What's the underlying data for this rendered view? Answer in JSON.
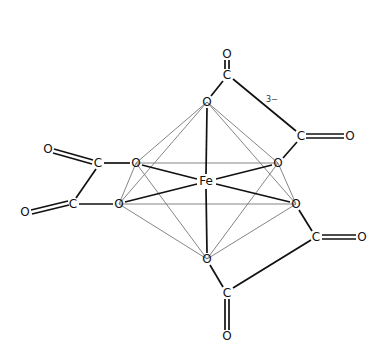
{
  "diagram": {
    "charge": "3−",
    "center": {
      "label": "Fe",
      "x": 206,
      "y": 181
    },
    "atoms": [
      {
        "id": "o_top_co",
        "label": "O",
        "x": 227,
        "y": 54
      },
      {
        "id": "c_top",
        "label": "C",
        "x": 227,
        "y": 75
      },
      {
        "id": "o_top",
        "label": "O",
        "x": 207,
        "y": 102
      },
      {
        "id": "c_right_up",
        "label": "C",
        "x": 301,
        "y": 136
      },
      {
        "id": "o_right_co",
        "label": "O",
        "x": 350,
        "y": 136
      },
      {
        "id": "o_right_up",
        "label": "O",
        "x": 278,
        "y": 163
      },
      {
        "id": "o_left_up",
        "label": "O",
        "x": 136,
        "y": 163
      },
      {
        "id": "c_left_up",
        "label": "C",
        "x": 98,
        "y": 163
      },
      {
        "id": "o_left_co",
        "label": "O",
        "x": 48,
        "y": 149
      },
      {
        "id": "o_left_low",
        "label": "O",
        "x": 119,
        "y": 204
      },
      {
        "id": "c_left_low",
        "label": "C",
        "x": 73,
        "y": 204
      },
      {
        "id": "o_left_co2",
        "label": "O",
        "x": 25,
        "y": 212
      },
      {
        "id": "o_right_low",
        "label": "O",
        "x": 296,
        "y": 204
      },
      {
        "id": "c_right_low",
        "label": "C",
        "x": 316,
        "y": 237
      },
      {
        "id": "o_right_co2",
        "label": "O",
        "x": 362,
        "y": 237
      },
      {
        "id": "o_bottom",
        "label": "O",
        "x": 207,
        "y": 259
      },
      {
        "id": "c_bottom",
        "label": "C",
        "x": 227,
        "y": 293
      },
      {
        "id": "o_bottom_co",
        "label": "O",
        "x": 227,
        "y": 336
      }
    ]
  }
}
